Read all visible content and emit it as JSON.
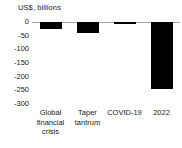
{
  "chart_data": {
    "type": "bar",
    "title": "",
    "ylabel": "US$, billions",
    "xlabel": "",
    "categories": [
      "Global financial crisis",
      "Taper tantrum",
      "COVID-19",
      "2022"
    ],
    "category_lines": [
      [
        "Global",
        "financial",
        "crisis"
      ],
      [
        "Taper",
        "tantrum"
      ],
      [
        "COVID-19"
      ],
      [
        "2022"
      ]
    ],
    "values": [
      -25,
      -42,
      -6,
      -245
    ],
    "ylim": [
      -300,
      0
    ],
    "yticks": [
      0,
      -50,
      -100,
      -150,
      -200,
      -250,
      -300
    ],
    "ytick_labels": [
      "0",
      "-50",
      "-100",
      "-150",
      "-200",
      "-250",
      "-300"
    ],
    "grid": false,
    "legend": null,
    "series": [
      {
        "name": "Portfolio flows",
        "values": [
          -25,
          -42,
          -6,
          -245
        ]
      }
    ],
    "bar_color": "#000000",
    "axis_color": "#a8a8a8",
    "text_color": "#1a1a1a"
  }
}
